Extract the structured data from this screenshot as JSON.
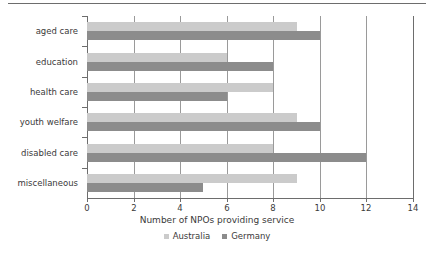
{
  "chart_data": {
    "type": "bar",
    "orientation": "horizontal",
    "title": "",
    "xlabel": "Number of NPOs providing service",
    "ylabel": "",
    "xlim": [
      0,
      14
    ],
    "xticks": [
      0,
      2,
      4,
      6,
      8,
      10,
      12,
      14
    ],
    "xtick_labels": [
      "0",
      "2",
      "4",
      "6",
      "8",
      "10",
      "12",
      "14"
    ],
    "grid": true,
    "grid_axis": "x",
    "legend_position": "bottom",
    "categories": [
      "aged care",
      "education",
      "health care",
      "youth welfare",
      "disabled care",
      "miscellaneous"
    ],
    "series": [
      {
        "name": "Australia",
        "color": "#cbcbcb",
        "values": [
          9,
          6,
          8,
          9,
          8,
          9
        ]
      },
      {
        "name": "Germany",
        "color": "#8c8c8c",
        "values": [
          10,
          8,
          6,
          10,
          12,
          5
        ]
      }
    ]
  },
  "colors": {
    "australia": "#cbcbcb",
    "germany": "#8c8c8c",
    "axis": "#6d6d6d",
    "gridline": "#9a9a9a",
    "text": "#3a3a3a",
    "background": "#ffffff"
  }
}
